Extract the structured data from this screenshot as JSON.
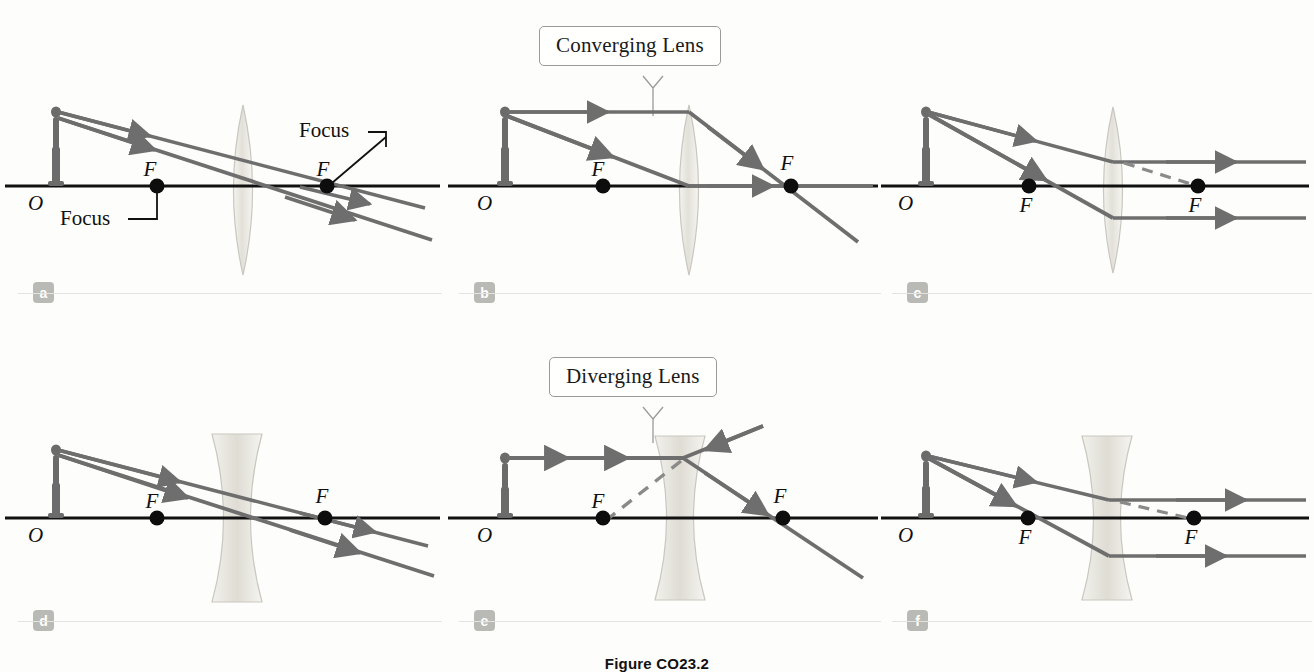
{
  "figure": {
    "caption": "Figure CO23.2",
    "background_color": "#fdfdfb",
    "ray_color": "#6e6e6e",
    "axis_color": "#111111",
    "lens_fill": "#e6e4dd",
    "badge_color": "#b9b9b5",
    "virtual_ray_style": "dashed"
  },
  "callouts": [
    {
      "id": "converging",
      "label": "Converging Lens"
    },
    {
      "id": "diverging",
      "label": "Diverging Lens"
    }
  ],
  "labels": {
    "origin": "O",
    "focus_point": "F",
    "focus_word": "Focus"
  },
  "panels": [
    {
      "id": "a",
      "badge": "a",
      "lens_type": "converging",
      "origin_label": "O",
      "focal_labels": [
        "F",
        "F"
      ],
      "annotations": [
        "Focus",
        "Focus"
      ],
      "ray_count": 2,
      "has_virtual_ray": false
    },
    {
      "id": "b",
      "badge": "b",
      "lens_type": "converging",
      "origin_label": "O",
      "focal_labels": [
        "F",
        "F"
      ],
      "annotations": [],
      "ray_count": 2,
      "has_virtual_ray": false
    },
    {
      "id": "c",
      "badge": "c",
      "lens_type": "converging",
      "origin_label": "O",
      "focal_labels": [
        "F",
        "F"
      ],
      "annotations": [],
      "ray_count": 2,
      "has_virtual_ray": true
    },
    {
      "id": "d",
      "badge": "d",
      "lens_type": "diverging",
      "origin_label": "O",
      "focal_labels": [
        "F",
        "F"
      ],
      "annotations": [],
      "ray_count": 2,
      "has_virtual_ray": false
    },
    {
      "id": "e",
      "badge": "e",
      "lens_type": "diverging",
      "origin_label": "O",
      "focal_labels": [
        "F",
        "F"
      ],
      "annotations": [],
      "ray_count": 2,
      "has_virtual_ray": true
    },
    {
      "id": "f",
      "badge": "f",
      "lens_type": "diverging",
      "origin_label": "O",
      "focal_labels": [
        "F",
        "F"
      ],
      "annotations": [],
      "ray_count": 2,
      "has_virtual_ray": true
    }
  ]
}
